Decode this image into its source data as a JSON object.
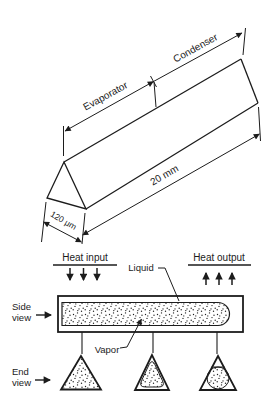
{
  "top_figure": {
    "evaporator_label": "Evaporator",
    "condenser_label": "Condenser",
    "length_label": "20 mm",
    "width_label": "120 μm"
  },
  "bottom_figure": {
    "heat_input_label": "Heat input",
    "heat_output_label": "Heat output",
    "liquid_label": "Liquid",
    "vapor_label": "Vapor",
    "side_view": {
      "lines": [
        "Side",
        "view"
      ]
    },
    "end_view": {
      "lines": [
        "End",
        "view"
      ]
    }
  },
  "colors": {
    "line": "#1c1c1c",
    "background": "#ffffff"
  }
}
